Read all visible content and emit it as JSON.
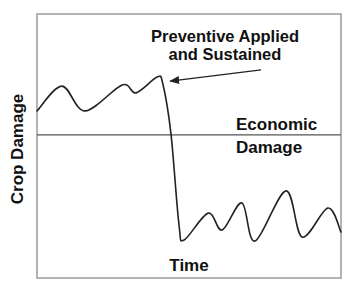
{
  "chart_data": {
    "type": "line",
    "title": "",
    "xlabel": "Time",
    "ylabel": "Crop Damage",
    "xlim": [
      0,
      100
    ],
    "ylim": [
      0,
      100
    ],
    "grid": false,
    "x_ticks": [],
    "y_ticks": [],
    "threshold": {
      "label_lines": [
        "Economic",
        "Damage"
      ],
      "value": 54.2
    },
    "annotation": {
      "text_lines": [
        "Preventive Applied",
        "and Sustained"
      ],
      "arrow_from": [
        73.7,
        78.8
      ],
      "arrow_to": [
        43.8,
        74.6
      ]
    },
    "series": [
      {
        "name": "Crop Damage",
        "color": "#222222",
        "x": [
          0,
          8.2,
          15.8,
          28.0,
          32.6,
          39.5,
          41.4,
          44.1,
          46.7,
          48.4,
          56.3,
          60.9,
          67.4,
          71.7,
          81.9,
          87.2,
          95.7,
          100
        ],
        "y": [
          63.3,
          72.7,
          63.3,
          73.1,
          70.1,
          76.1,
          73.5,
          54.2,
          20.1,
          14.4,
          24.6,
          18.2,
          28.4,
          14.0,
          33.0,
          15.5,
          26.5,
          17.4
        ]
      }
    ],
    "colors": {
      "frame": "#9a9a9a",
      "threshold": "#555555",
      "curve": "#222222",
      "text": "#111111"
    }
  }
}
